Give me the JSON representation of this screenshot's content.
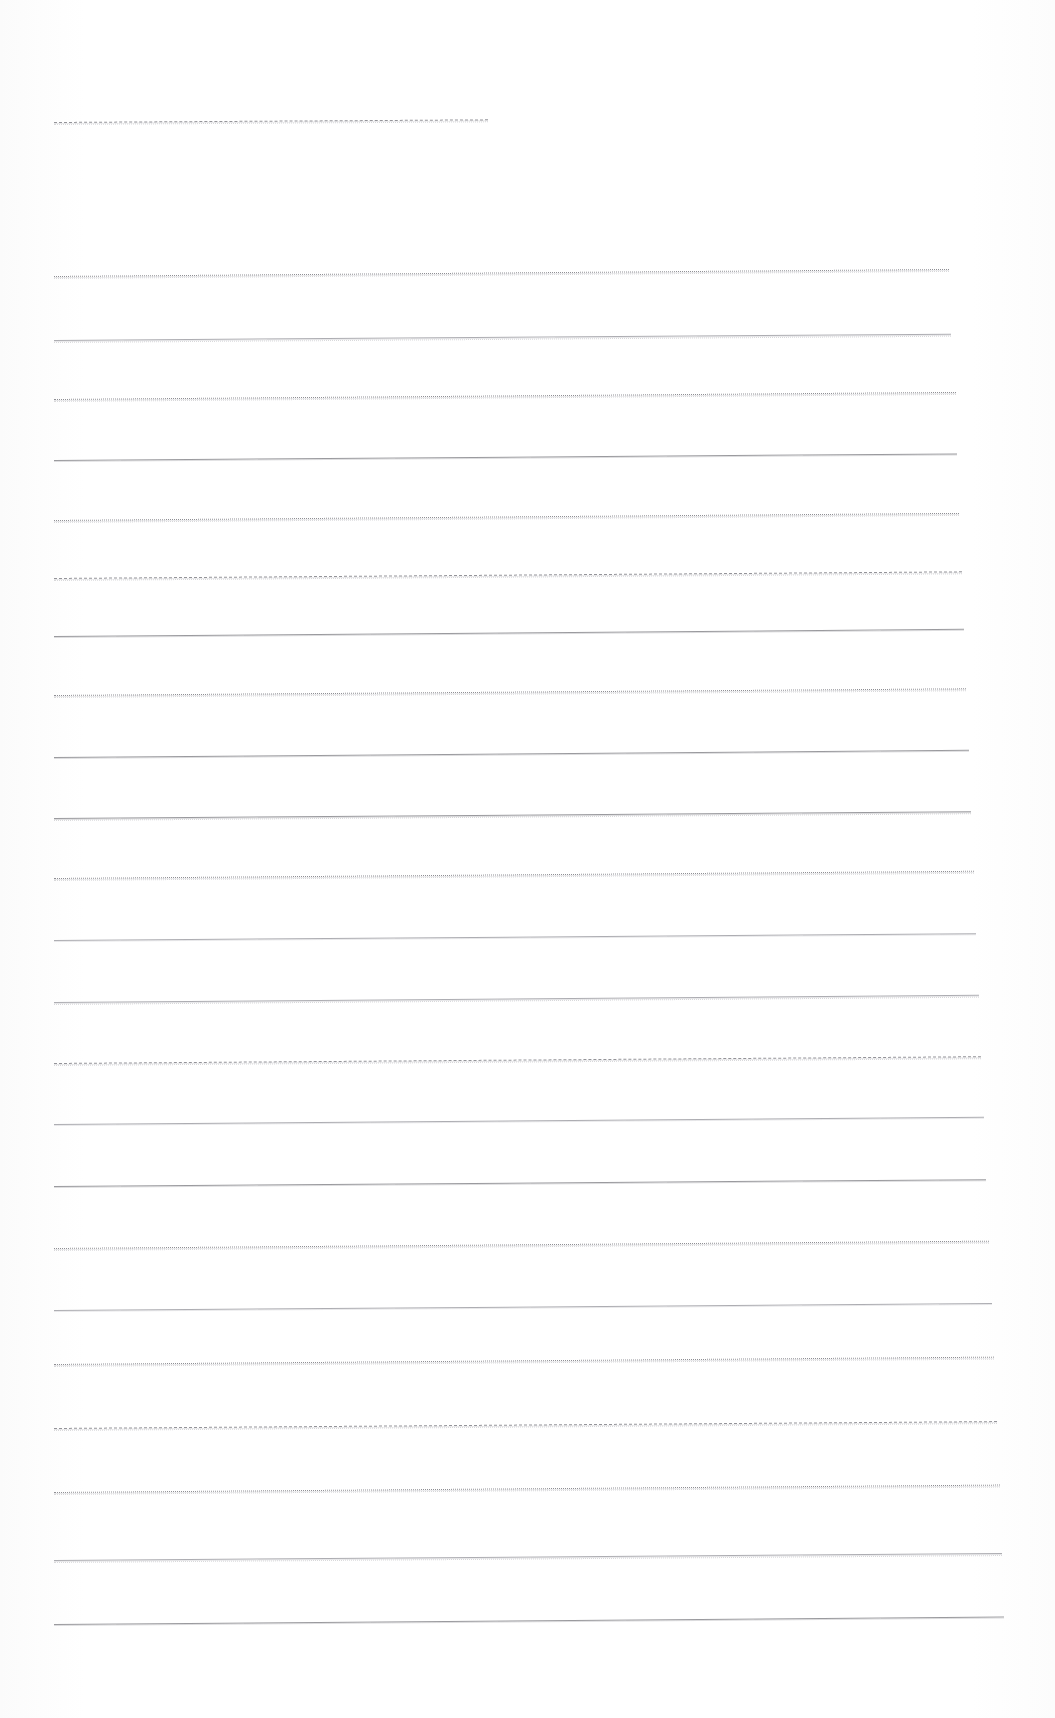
{
  "page": {
    "width": 1055,
    "height": 1718,
    "background_color": "#fefefe",
    "rule_color": "#9a9a9e",
    "rule_color_light": "#adadb2",
    "visible_text": "",
    "note": "Blank scanned lined sheet - no legible text content present"
  },
  "rules": [
    {
      "name": "header-rule",
      "x": 54,
      "y": 122,
      "width": 434,
      "style": "dashed",
      "skew": -0.35,
      "ghost": true
    },
    {
      "name": "rule-1",
      "x": 54,
      "y": 276,
      "width": 895,
      "style": "dotted",
      "skew": -0.45,
      "ghost": true
    },
    {
      "name": "rule-2",
      "x": 54,
      "y": 340,
      "width": 897,
      "style": "faint",
      "skew": -0.4,
      "ghost": true
    },
    {
      "name": "rule-3",
      "x": 54,
      "y": 399,
      "width": 902,
      "style": "dotted",
      "skew": -0.45,
      "ghost": true
    },
    {
      "name": "rule-4",
      "x": 54,
      "y": 460,
      "width": 903,
      "style": "solid",
      "skew": -0.42,
      "ghost": false
    },
    {
      "name": "rule-5",
      "x": 54,
      "y": 520,
      "width": 905,
      "style": "dotted",
      "skew": -0.45,
      "ghost": true
    },
    {
      "name": "rule-6",
      "x": 54,
      "y": 578,
      "width": 908,
      "style": "dashed",
      "skew": -0.42,
      "ghost": true
    },
    {
      "name": "rule-7",
      "x": 54,
      "y": 636,
      "width": 910,
      "style": "solid",
      "skew": -0.45,
      "ghost": false
    },
    {
      "name": "rule-8",
      "x": 54,
      "y": 695,
      "width": 912,
      "style": "dotted",
      "skew": -0.42,
      "ghost": true
    },
    {
      "name": "rule-9",
      "x": 54,
      "y": 757,
      "width": 915,
      "style": "solid",
      "skew": -0.45,
      "ghost": false
    },
    {
      "name": "rule-10",
      "x": 54,
      "y": 818,
      "width": 917,
      "style": "solid",
      "skew": -0.42,
      "ghost": true
    },
    {
      "name": "rule-11",
      "x": 54,
      "y": 878,
      "width": 920,
      "style": "dotted",
      "skew": -0.45,
      "ghost": true
    },
    {
      "name": "rule-12",
      "x": 54,
      "y": 940,
      "width": 922,
      "style": "faint",
      "skew": -0.42,
      "ghost": false
    },
    {
      "name": "rule-13",
      "x": 54,
      "y": 1002,
      "width": 925,
      "style": "faint",
      "skew": -0.45,
      "ghost": true
    },
    {
      "name": "rule-14",
      "x": 54,
      "y": 1063,
      "width": 927,
      "style": "dashed",
      "skew": -0.42,
      "ghost": true
    },
    {
      "name": "rule-15",
      "x": 54,
      "y": 1124,
      "width": 930,
      "style": "faint",
      "skew": -0.45,
      "ghost": false
    },
    {
      "name": "rule-16",
      "x": 54,
      "y": 1186,
      "width": 932,
      "style": "solid",
      "skew": -0.42,
      "ghost": false
    },
    {
      "name": "rule-17",
      "x": 54,
      "y": 1248,
      "width": 935,
      "style": "dotted",
      "skew": -0.45,
      "ghost": true
    },
    {
      "name": "rule-18",
      "x": 54,
      "y": 1310,
      "width": 938,
      "style": "faint",
      "skew": -0.42,
      "ghost": false
    },
    {
      "name": "rule-19",
      "x": 54,
      "y": 1364,
      "width": 940,
      "style": "dotted",
      "skew": -0.45,
      "ghost": true
    },
    {
      "name": "rule-20",
      "x": 54,
      "y": 1428,
      "width": 943,
      "style": "dashed",
      "skew": -0.42,
      "ghost": true
    },
    {
      "name": "rule-21",
      "x": 54,
      "y": 1492,
      "width": 946,
      "style": "dotted",
      "skew": -0.45,
      "ghost": true
    },
    {
      "name": "rule-22",
      "x": 54,
      "y": 1560,
      "width": 948,
      "style": "faint",
      "skew": -0.42,
      "ghost": true
    },
    {
      "name": "rule-23",
      "x": 54,
      "y": 1624,
      "width": 950,
      "style": "solid",
      "skew": -0.45,
      "ghost": false
    }
  ]
}
